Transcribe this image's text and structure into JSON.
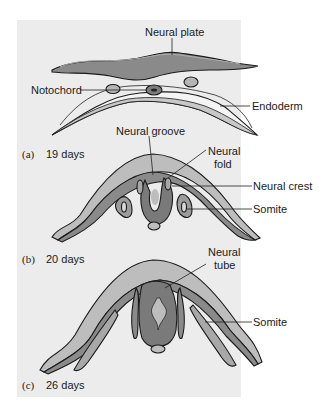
{
  "figure": {
    "panels": [
      {
        "id": "a",
        "letter": "(a)",
        "age": "19 days",
        "labels": {
          "neural_plate": "Neural plate",
          "notochord": "Notochord",
          "endoderm": "Endoderm"
        }
      },
      {
        "id": "b",
        "letter": "(b)",
        "age": "20 days",
        "labels": {
          "neural_groove": "Neural groove",
          "neural_fold_1": "Neural",
          "neural_fold_2": "fold",
          "neural_crest": "Neural crest",
          "somite": "Somite"
        }
      },
      {
        "id": "c",
        "letter": "(c)",
        "age": "26 days",
        "labels": {
          "neural_tube_1": "Neural",
          "neural_tube_2": "tube",
          "somite": "Somite"
        }
      }
    ]
  },
  "colors": {
    "panel_bg": "#ececec",
    "ectoderm_light": "#bdbdbd",
    "neural_dark": "#7a7a7a",
    "mesoderm_mid": "#9c9c9c",
    "endoderm_fill": "#f4f4f4",
    "outline": "#1a1a1a"
  }
}
